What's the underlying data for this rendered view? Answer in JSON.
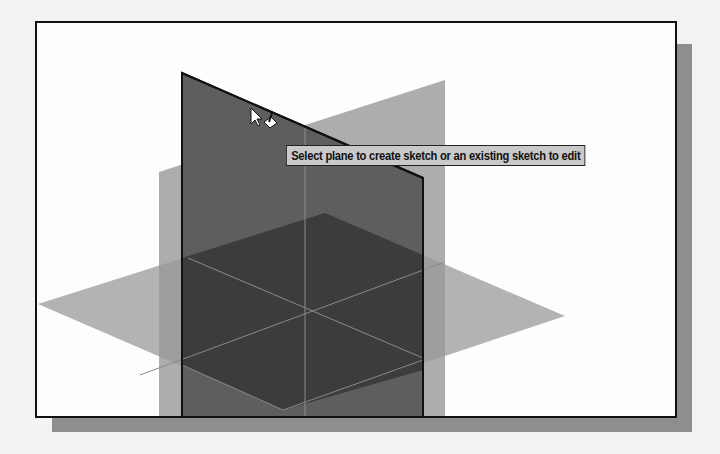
{
  "viewport": {
    "tooltip": "Select plane to create sketch or an existing sketch to edit"
  },
  "planes": [
    {
      "name": "front-plane",
      "state": "highlighted"
    },
    {
      "name": "right-plane",
      "state": "visible"
    },
    {
      "name": "top-plane",
      "state": "visible"
    }
  ],
  "cursor": {
    "type": "select-sketch-cursor"
  },
  "colors": {
    "front_plane": "#5c5c5c",
    "back_plane": "#a8a8a8",
    "top_plane": "#b0b0b0",
    "overlap": "#3e3e3e",
    "tooltip_bg": "#c9c9c9"
  }
}
